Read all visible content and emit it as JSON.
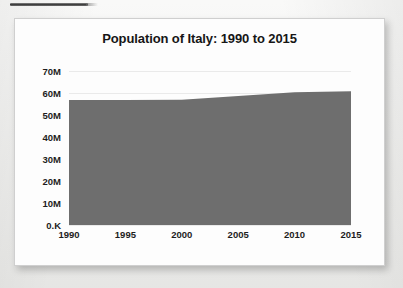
{
  "page": {
    "top_rule_name": "horizontal-rule"
  },
  "chart_data": {
    "type": "area",
    "title": "Population of Italy: 1990 to 2015",
    "xlabel": "",
    "ylabel": "",
    "x": [
      1990,
      1995,
      2000,
      2005,
      2010,
      2015
    ],
    "values": [
      56800000,
      56850000,
      56950000,
      58600000,
      60300000,
      60800000
    ],
    "series": [
      {
        "name": "Population of Italy",
        "values": [
          56800000,
          56850000,
          56950000,
          58600000,
          60300000,
          60800000
        ]
      }
    ],
    "xlim": [
      1990,
      2015
    ],
    "ylim": [
      0,
      70000000
    ],
    "xtick_labels": [
      "1990",
      "1995",
      "2000",
      "2005",
      "2010",
      "2015"
    ],
    "ytick_labels": [
      "70M",
      "60M",
      "50M",
      "40M",
      "30M",
      "20M",
      "10M",
      "0.K"
    ],
    "ytick_values": [
      70000000,
      60000000,
      50000000,
      40000000,
      30000000,
      20000000,
      10000000,
      0
    ],
    "grid": true,
    "legend": false,
    "legend_position": "none",
    "area_color": "#6e6e6e",
    "grid_color": "#eaeaea",
    "text_color": "#1d1d1d",
    "background": "#fdfdfd"
  }
}
